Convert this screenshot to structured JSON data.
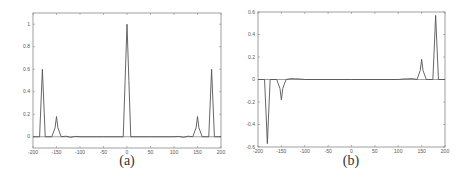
{
  "chart_data": [
    {
      "type": "line",
      "panel_label": "(a)",
      "title": "",
      "xlabel": "",
      "ylabel": "",
      "xlim": [
        -200,
        200
      ],
      "ylim": [
        -0.1,
        1.1
      ],
      "xticks": [
        -200,
        -150,
        -100,
        -50,
        0,
        50,
        100,
        150,
        200
      ],
      "xtick_labels": [
        "-200",
        "-150",
        "-100",
        "-50",
        "0",
        "50",
        "100",
        "150",
        "200"
      ],
      "yticks": [
        0,
        0.2,
        0.4,
        0.6,
        0.8,
        1
      ],
      "ytick_labels": [
        "0",
        "0.2",
        "0.4",
        "0.6",
        "0.8",
        "1"
      ],
      "grid": false,
      "series": [
        {
          "name": "signal",
          "x": [
            -200,
            -186,
            -183,
            -180,
            -177,
            -174,
            -160,
            -153,
            -150,
            -147,
            -140,
            -130,
            -120,
            -110,
            -100,
            -50,
            -8,
            -4,
            0,
            4,
            8,
            50,
            100,
            110,
            120,
            130,
            140,
            147,
            150,
            153,
            160,
            174,
            177,
            180,
            183,
            186,
            200
          ],
          "y": [
            0,
            0,
            0.3,
            0.6,
            0.3,
            0,
            0,
            0.08,
            0.18,
            0.08,
            0,
            0.005,
            -0.005,
            0.003,
            0,
            0,
            0,
            0.5,
            1.0,
            0.5,
            0,
            0,
            0,
            0.003,
            -0.005,
            0.005,
            0,
            0.08,
            0.18,
            0.08,
            0,
            0,
            0.3,
            0.6,
            0.3,
            0,
            0
          ]
        }
      ],
      "peaks": [
        {
          "x": -180,
          "y": 0.6
        },
        {
          "x": -150,
          "y": 0.18
        },
        {
          "x": 0,
          "y": 1.0
        },
        {
          "x": 150,
          "y": 0.18
        },
        {
          "x": 180,
          "y": 0.6
        }
      ]
    },
    {
      "type": "line",
      "panel_label": "(b)",
      "title": "",
      "xlabel": "",
      "ylabel": "",
      "xlim": [
        -200,
        200
      ],
      "ylim": [
        -0.6,
        0.6
      ],
      "xticks": [
        -200,
        -150,
        -100,
        -50,
        0,
        50,
        100,
        150,
        200
      ],
      "xtick_labels": [
        "-200",
        "-150",
        "-100",
        "-50",
        "0",
        "50",
        "100",
        "150",
        "200"
      ],
      "yticks": [
        -0.6,
        -0.4,
        -0.2,
        0,
        0.2,
        0.4,
        0.6
      ],
      "ytick_labels": [
        "-0.6",
        "-0.4",
        "-0.2",
        "0",
        "0.2",
        "0.4",
        "0.6"
      ],
      "grid": false,
      "series": [
        {
          "name": "signal",
          "x": [
            -200,
            -186,
            -183,
            -180,
            -177,
            -174,
            -160,
            -153,
            -150,
            -147,
            -140,
            -130,
            -120,
            -110,
            -100,
            0,
            100,
            110,
            120,
            130,
            140,
            147,
            150,
            153,
            160,
            174,
            177,
            180,
            183,
            186,
            200
          ],
          "y": [
            0,
            0,
            -0.28,
            -0.57,
            -0.28,
            0,
            0,
            -0.08,
            -0.18,
            -0.08,
            0,
            0.008,
            0.006,
            0.004,
            0,
            0,
            0,
            0.004,
            0.006,
            0.008,
            0,
            0.08,
            0.18,
            0.08,
            0,
            0,
            0.28,
            0.57,
            0.28,
            0,
            0
          ]
        }
      ],
      "peaks": [
        {
          "x": -180,
          "y": -0.57
        },
        {
          "x": -150,
          "y": -0.18
        },
        {
          "x": 150,
          "y": 0.18
        },
        {
          "x": 180,
          "y": 0.57
        }
      ]
    }
  ]
}
